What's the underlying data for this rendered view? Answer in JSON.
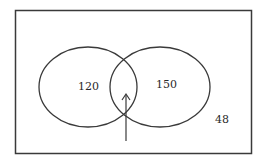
{
  "diagram": {
    "type": "venn",
    "regions": {
      "left_only": "120",
      "right_only": "150",
      "outside": "48",
      "intersection": ""
    },
    "colors": {
      "stroke": "#3a3a3a",
      "background": "#ffffff"
    }
  }
}
